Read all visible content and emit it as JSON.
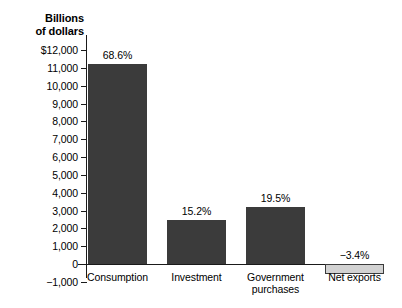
{
  "chart_data": {
    "type": "bar",
    "title": "",
    "xlabel": "",
    "ylabel": "Billions\nof dollars",
    "categories": [
      "Consumption",
      "Investment",
      "Government\npurchases",
      "Net exports"
    ],
    "values": [
      11200,
      2480,
      3180,
      -555
    ],
    "data_labels": [
      "68.6%",
      "15.2%",
      "19.5%",
      "−3.4%"
    ],
    "ylim": [
      -1000,
      12000
    ],
    "ytick_labels": [
      "$12,000",
      "11,000",
      "10,000",
      "9,000",
      "8,000",
      "7,000",
      "6,000",
      "5,000",
      "4,000",
      "3,000",
      "2,000",
      "1,000",
      "0",
      "−1,000"
    ],
    "ytick_values": [
      12000,
      11000,
      10000,
      9000,
      8000,
      7000,
      6000,
      5000,
      4000,
      3000,
      2000,
      1000,
      0,
      -1000
    ],
    "grid": false,
    "legend": "none",
    "colors": {
      "positive_bar": "#3b3b3b",
      "negative_bar": "#d2d2d2",
      "negative_bar_border": "#3b3b3b",
      "axis": "#1a1a1a",
      "background": "#ffffff",
      "text": "#000000"
    }
  }
}
